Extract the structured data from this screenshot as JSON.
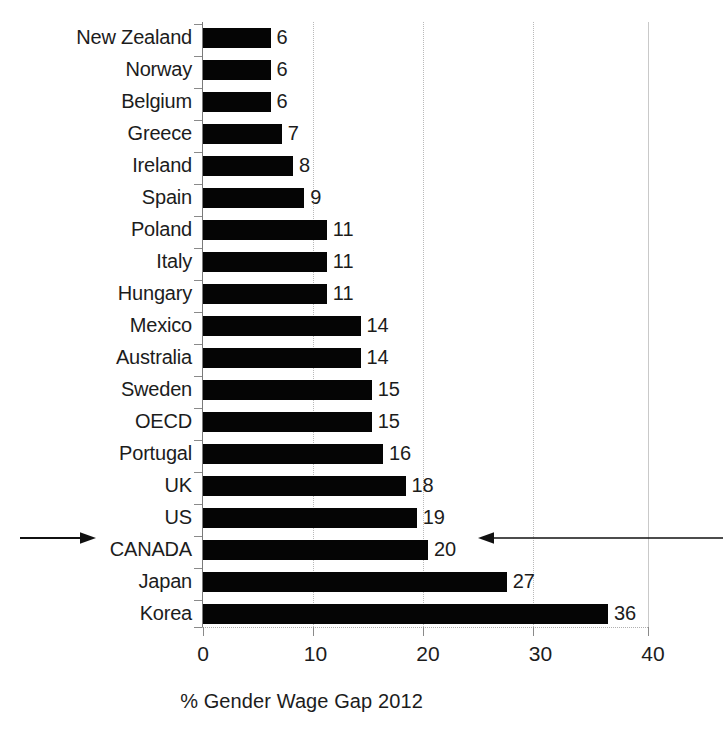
{
  "chart_data": {
    "type": "bar",
    "orientation": "horizontal",
    "title": "",
    "xlabel": "% Gender Wage Gap 2012",
    "ylabel": "",
    "xlim": [
      0,
      40
    ],
    "xticks": [
      0,
      10,
      20,
      30,
      40
    ],
    "xtick_labels": [
      "0",
      "10",
      "20",
      "30",
      "40"
    ],
    "grid": true,
    "grid_axis": "x",
    "legend": null,
    "bar_color": "#050505",
    "categories": [
      "New Zealand",
      "Norway",
      "Belgium",
      "Greece",
      "Ireland",
      "Spain",
      "Poland",
      "Italy",
      "Hungary",
      "Mexico",
      "Australia",
      "Sweden",
      "OECD",
      "Portugal",
      "UK",
      "US",
      "CANADA",
      "Japan",
      "Korea"
    ],
    "values": [
      6,
      6,
      6,
      7,
      8,
      9,
      11,
      11,
      11,
      14,
      14,
      15,
      15,
      16,
      18,
      19,
      20,
      27,
      36
    ],
    "data_labels": [
      "6",
      "6",
      "6",
      "7",
      "8",
      "9",
      "11",
      "11",
      "11",
      "14",
      "14",
      "15",
      "15",
      "16",
      "18",
      "19",
      "20",
      "27",
      "36"
    ],
    "annotations": [
      {
        "name": "canada-left-arrow",
        "target_category": "CANADA",
        "direction": "right",
        "side": "left-of-label"
      },
      {
        "name": "canada-right-arrow",
        "target_category": "CANADA",
        "direction": "left",
        "side": "right-of-value"
      }
    ]
  },
  "axis": {
    "title": "% Gender Wage Gap 2012",
    "ticks": [
      "0",
      "10",
      "20",
      "30",
      "40"
    ]
  }
}
